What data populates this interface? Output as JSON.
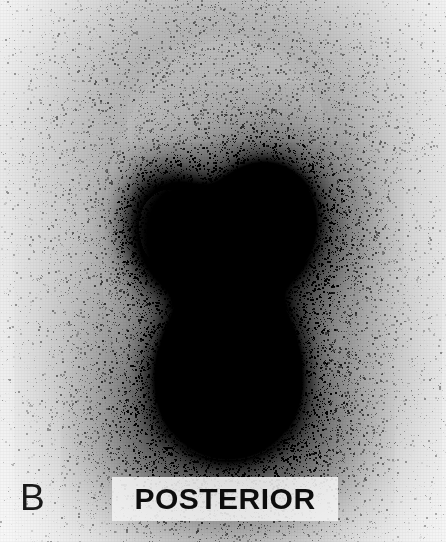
{
  "figure": {
    "panel_letter": "B",
    "orientation_label": "POSTERIOR",
    "modality": "renal-scintigraphy",
    "view": "posterior",
    "background_color": "#ffffff",
    "field_color": "#fdfdfd",
    "activity_color": "#000000",
    "label_plate_color": "#f3f3f3",
    "label_text_color": "#0d0d0d",
    "panel_letter_color": "#1a1a1a"
  },
  "icons": {
    "panel_letter_name": "panel-letter-b",
    "orientation_name": "orientation-label-posterior"
  },
  "chart_data": {
    "type": "heatmap",
    "title": "POSTERIOR",
    "subtitle": "B",
    "xlabel": "",
    "ylabel": "",
    "grid": false,
    "legend": "none",
    "colormap": "grayscale-inverted",
    "value_range": [
      0,
      1
    ],
    "field": {
      "x": 0,
      "y": 0,
      "width": 446,
      "height": 542
    },
    "noise": {
      "seed": 20240617,
      "grain_points": 52000,
      "base_level": 0.02
    },
    "regions": [
      {
        "name": "soft-tissue-background",
        "label": "diffuse body background activity",
        "shape": "ellipse",
        "cx": 228,
        "cy": 250,
        "rx": 128,
        "ry": 210,
        "intensity": 0.16,
        "falloff": 1.5,
        "speckle": 0.55
      },
      {
        "name": "upper-torso-background",
        "label": "upper torso soft tissue",
        "shape": "ellipse",
        "cx": 224,
        "cy": 120,
        "rx": 98,
        "ry": 86,
        "intensity": 0.13,
        "falloff": 1.7,
        "speckle": 0.6
      },
      {
        "name": "left-kidney",
        "label": "left kidney (image left) - moderate uptake",
        "shape": "ellipse",
        "cx": 172,
        "cy": 231,
        "rx": 33,
        "ry": 42,
        "rotation": -12,
        "intensity": 0.62,
        "falloff": 1.25,
        "speckle": 0.85
      },
      {
        "name": "right-kidney",
        "label": "right kidney (image right) - intense uptake",
        "shape": "ellipse",
        "cx": 262,
        "cy": 222,
        "rx": 34,
        "ry": 38,
        "rotation": 8,
        "intensity": 0.96,
        "falloff": 1.05,
        "speckle": 0.5
      },
      {
        "name": "right-kidney-halo",
        "label": "perinephric activity around right kidney",
        "shape": "ellipse",
        "cx": 268,
        "cy": 224,
        "rx": 52,
        "ry": 54,
        "intensity": 0.34,
        "falloff": 1.6,
        "speckle": 0.9
      },
      {
        "name": "urinary-bladder",
        "label": "urinary bladder - marked tracer accumulation",
        "shape": "ellipse",
        "cx": 228,
        "cy": 372,
        "rx": 54,
        "ry": 60,
        "intensity": 1.0,
        "falloff": 0.85,
        "speckle": 0.25
      },
      {
        "name": "bladder-halo",
        "label": "scatter halo around bladder",
        "shape": "ellipse",
        "cx": 228,
        "cy": 372,
        "rx": 82,
        "ry": 88,
        "intensity": 0.3,
        "falloff": 1.7,
        "speckle": 0.95
      },
      {
        "name": "inferior-scatter",
        "label": "inferior scatter / pelvic activity",
        "shape": "ellipse",
        "cx": 228,
        "cy": 450,
        "rx": 64,
        "ry": 40,
        "intensity": 0.18,
        "falloff": 1.9,
        "speckle": 1.0
      }
    ]
  }
}
